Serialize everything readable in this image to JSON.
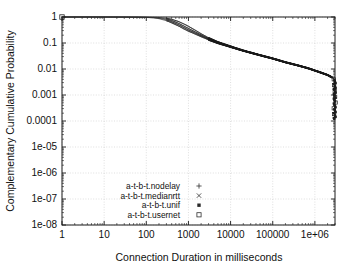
{
  "chart_data": {
    "type": "line",
    "title": "",
    "xlabel": "Connection Duration in milliseconds",
    "ylabel": "Complementary Cumulative Probability",
    "xscale": "log",
    "yscale": "log",
    "xlim": [
      1,
      3000000
    ],
    "ylim": [
      1e-08,
      1
    ],
    "grid": true,
    "legend_position": "lower-center-left",
    "xticks": [
      "1",
      "10",
      "100",
      "1000",
      "10000",
      "100000",
      "1e+06"
    ],
    "xtick_values": [
      1,
      10,
      100,
      1000,
      10000,
      100000,
      1000000
    ],
    "yticks": [
      "1",
      "0.1",
      "0.01",
      "0.001",
      "0.0001",
      "1e-05",
      "1e-06",
      "1e-07",
      "1e-08"
    ],
    "ytick_values": [
      1,
      0.1,
      0.01,
      0.001,
      0.0001,
      1e-05,
      1e-06,
      1e-07,
      1e-08
    ],
    "series": [
      {
        "name": "a-t-b-t.nodelay",
        "marker": "plus",
        "marker_glyph": "+",
        "x": [
          1,
          3,
          10,
          30,
          60,
          100,
          150,
          200,
          300,
          400,
          600,
          800,
          1000,
          1500,
          2000,
          3000,
          5000,
          8000,
          12000,
          20000,
          35000,
          60000,
          100000,
          200000,
          400000,
          700000,
          1200000,
          2000000,
          2600000,
          2900000,
          3000000
        ],
        "y": [
          1.0,
          1.0,
          0.995,
          0.985,
          0.975,
          0.96,
          0.92,
          0.86,
          0.72,
          0.6,
          0.44,
          0.34,
          0.285,
          0.215,
          0.175,
          0.132,
          0.098,
          0.078,
          0.064,
          0.05,
          0.039,
          0.031,
          0.025,
          0.018,
          0.0135,
          0.0105,
          0.0078,
          0.0058,
          0.0046,
          0.004,
          0.0011
        ]
      },
      {
        "name": "a-t-b-t.medianrtt",
        "marker": "cross",
        "marker_glyph": "×",
        "x": [
          1,
          3,
          10,
          30,
          60,
          100,
          150,
          200,
          300,
          400,
          600,
          800,
          1000,
          1500,
          2000,
          3000,
          5000,
          8000,
          12000,
          20000,
          35000,
          60000,
          100000,
          200000,
          400000,
          700000,
          1200000,
          2000000,
          2600000,
          2900000,
          3000000
        ],
        "y": [
          1.0,
          1.0,
          0.998,
          0.992,
          0.985,
          0.975,
          0.955,
          0.925,
          0.84,
          0.74,
          0.56,
          0.44,
          0.365,
          0.26,
          0.205,
          0.148,
          0.105,
          0.082,
          0.066,
          0.051,
          0.04,
          0.0315,
          0.0254,
          0.0182,
          0.0137,
          0.0106,
          0.0079,
          0.0059,
          0.0047,
          0.0041,
          0.0012
        ]
      },
      {
        "name": "a-t-b-t.unif",
        "marker": "filled-square",
        "marker_glyph": "■",
        "x": [
          1,
          3,
          10,
          30,
          60,
          100,
          150,
          200,
          300,
          400,
          600,
          800,
          1000,
          1500,
          2000,
          3000,
          5000,
          8000,
          12000,
          20000,
          35000,
          60000,
          100000,
          200000,
          400000,
          700000,
          1200000,
          2000000,
          2600000,
          2900000,
          3000000
        ],
        "y": [
          1.0,
          1.0,
          0.999,
          0.996,
          0.992,
          0.986,
          0.975,
          0.958,
          0.9,
          0.82,
          0.66,
          0.53,
          0.44,
          0.3,
          0.228,
          0.158,
          0.11,
          0.085,
          0.068,
          0.052,
          0.0405,
          0.032,
          0.0258,
          0.0185,
          0.0139,
          0.0108,
          0.008,
          0.006,
          0.0048,
          0.0042,
          0.0013
        ]
      },
      {
        "name": "a-t-b-t.usernet",
        "marker": "open-square",
        "marker_glyph": "□",
        "x": [
          1,
          3,
          10,
          30,
          60,
          100,
          150,
          200,
          300,
          400,
          600,
          800,
          1000,
          1500,
          2000,
          3000,
          5000,
          8000,
          12000,
          20000,
          35000,
          60000,
          100000,
          200000,
          400000,
          700000,
          1200000,
          2000000,
          2600000,
          2900000,
          3000000
        ],
        "y": [
          1.0,
          1.0,
          0.997,
          0.989,
          0.98,
          0.968,
          0.94,
          0.895,
          0.78,
          0.665,
          0.495,
          0.385,
          0.32,
          0.235,
          0.19,
          0.14,
          0.101,
          0.08,
          0.065,
          0.0505,
          0.0395,
          0.0312,
          0.0252,
          0.0181,
          0.0136,
          0.0106,
          0.0079,
          0.0059,
          0.0047,
          0.0041,
          0.001
        ]
      }
    ],
    "tail_scatter": {
      "note": "dense vertical cluster of points at the right edge dropping from ~4e-3 to ~1e-4",
      "x": 2950000,
      "y_from": 0.004,
      "y_to": 0.00012
    }
  }
}
